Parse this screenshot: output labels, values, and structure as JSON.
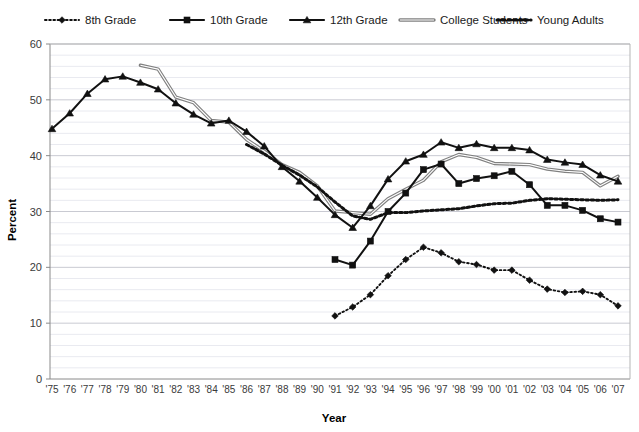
{
  "chart_data": {
    "type": "line",
    "title": "",
    "xlabel": "Year",
    "ylabel": "Percent",
    "ylim": [
      0,
      60
    ],
    "yticks": [
      0,
      10,
      20,
      30,
      40,
      50,
      60
    ],
    "yminor_step": 2,
    "grid": true,
    "legend_position": "top",
    "x": [
      "'75",
      "'76",
      "'77",
      "'78",
      "'79",
      "'80",
      "'81",
      "'82",
      "'83",
      "'84",
      "'85",
      "'86",
      "'87",
      "'88",
      "'89",
      "'90",
      "'91",
      "'92",
      "'93",
      "'94",
      "'95",
      "'96",
      "'97",
      "'98",
      "'99",
      "'00",
      "'01",
      "'02",
      "'03",
      "'04",
      "'05",
      "'06",
      "'07"
    ],
    "categories": [
      "'75",
      "'76",
      "'77",
      "'78",
      "'79",
      "'80",
      "'81",
      "'82",
      "'83",
      "'84",
      "'85",
      "'86",
      "'87",
      "'88",
      "'89",
      "'90",
      "'91",
      "'92",
      "'93",
      "'94",
      "'95",
      "'96",
      "'97",
      "'98",
      "'99",
      "'00",
      "'01",
      "'02",
      "'03",
      "'04",
      "'05",
      "'06",
      "'07"
    ],
    "series": [
      {
        "name": "8th Grade",
        "marker": "diamond",
        "line_style": "dotted",
        "color": "#111111",
        "values": [
          null,
          null,
          null,
          null,
          null,
          null,
          null,
          null,
          null,
          null,
          null,
          null,
          null,
          null,
          null,
          null,
          11.3,
          12.9,
          15.1,
          18.5,
          21.4,
          23.6,
          22.6,
          21.0,
          20.5,
          19.5,
          19.5,
          17.7,
          16.1,
          15.5,
          15.7,
          15.1,
          13.1
        ]
      },
      {
        "name": "10th Grade",
        "marker": "square",
        "line_style": "solid",
        "color": "#111111",
        "values": [
          null,
          null,
          null,
          null,
          null,
          null,
          null,
          null,
          null,
          null,
          null,
          null,
          null,
          null,
          null,
          null,
          21.4,
          20.4,
          24.7,
          30.0,
          33.3,
          37.5,
          38.5,
          35.0,
          35.9,
          36.4,
          37.2,
          34.8,
          31.1,
          31.1,
          30.2,
          28.7,
          28.1
        ]
      },
      {
        "name": "12th Grade",
        "marker": "triangle",
        "line_style": "solid",
        "color": "#111111",
        "values": [
          44.8,
          47.6,
          51.1,
          53.7,
          54.2,
          53.1,
          51.9,
          49.4,
          47.4,
          45.8,
          46.3,
          44.3,
          41.7,
          38.0,
          35.4,
          32.5,
          29.4,
          27.1,
          31.0,
          35.8,
          39.0,
          40.2,
          42.4,
          41.4,
          42.1,
          41.4,
          41.4,
          41.0,
          39.3,
          38.8,
          38.4,
          36.5,
          35.4
        ]
      },
      {
        "name": "College Students",
        "marker": "none",
        "line_style": "solid",
        "color": "#808080",
        "values": [
          null,
          null,
          null,
          null,
          null,
          56.2,
          55.5,
          50.5,
          49.5,
          46.3,
          46.0,
          42.9,
          40.8,
          38.4,
          37.0,
          34.6,
          30.1,
          29.8,
          29.5,
          32.3,
          34.0,
          35.6,
          38.9,
          40.2,
          39.7,
          38.6,
          38.5,
          38.4,
          37.6,
          37.2,
          37.0,
          34.6,
          36.3
        ]
      },
      {
        "name": "Young Adults",
        "marker": "none",
        "line_style": "dotted-thick",
        "color": "#111111",
        "values": [
          null,
          null,
          null,
          null,
          null,
          null,
          null,
          null,
          null,
          null,
          null,
          42.0,
          40.3,
          38.3,
          36.5,
          34.4,
          31.7,
          29.2,
          28.6,
          29.8,
          29.8,
          30.1,
          30.3,
          30.5,
          31.0,
          31.4,
          31.5,
          32.0,
          32.3,
          32.2,
          32.1,
          32.0,
          32.1
        ]
      }
    ]
  },
  "legend": {
    "items": [
      {
        "label": "8th Grade",
        "marker": "diamond",
        "style": "dotted"
      },
      {
        "label": "10th Grade",
        "marker": "square",
        "style": "solid"
      },
      {
        "label": "12th Grade",
        "marker": "triangle",
        "style": "solid"
      },
      {
        "label": "College Students",
        "marker": "none",
        "style": "solid-gray"
      },
      {
        "label": "Young Adults",
        "marker": "none",
        "style": "dotted-thick"
      }
    ]
  },
  "axes": {
    "y_title": "Percent",
    "x_title": "Year",
    "y_tick_labels": [
      "0",
      "10",
      "20",
      "30",
      "40",
      "50",
      "60"
    ]
  },
  "colors": {
    "ink": "#111111",
    "gray_series": "#808080",
    "minor_grid": "#e9eaf0",
    "major_grid": "#c9cad2",
    "axis": "#8a8a8a"
  }
}
